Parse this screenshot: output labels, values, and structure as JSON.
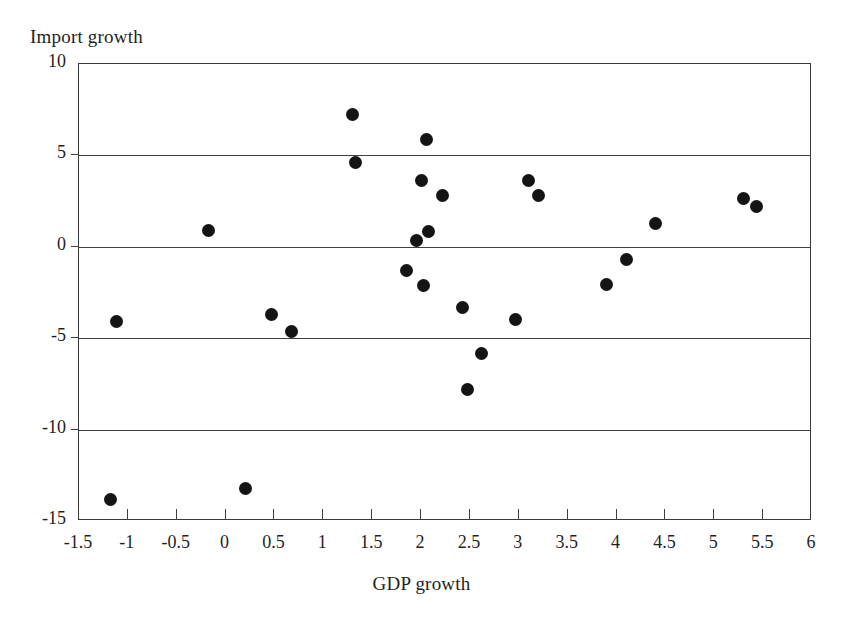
{
  "chart": {
    "type": "scatter",
    "ylabel": "Import growth",
    "xlabel": "GDP growth",
    "title": ""
  },
  "chart_data": {
    "type": "scatter",
    "title": "",
    "xlabel": "GDP growth",
    "ylabel": "Import growth",
    "xlim": [
      -1.5,
      6
    ],
    "ylim": [
      -15,
      10
    ],
    "xticks": [
      -1.5,
      -1,
      -0.5,
      0,
      0.5,
      1,
      1.5,
      2,
      2.5,
      3,
      3.5,
      4,
      4.5,
      5,
      5.5,
      6
    ],
    "xtick_labels": [
      "-1.5",
      "-1",
      "-0.5",
      "0",
      "0.5",
      "1",
      "1.5",
      "2",
      "2.5",
      "3",
      "3.5",
      "4",
      "4.5",
      "5",
      "5.5",
      "6"
    ],
    "yticks": [
      10,
      5,
      0,
      -5,
      -10,
      -15
    ],
    "ytick_labels": [
      "10",
      "5",
      "0",
      "-5",
      "-10",
      "-15"
    ],
    "grid": "horizontal",
    "legend": "none",
    "marker": "filled-circle",
    "marker_color": "#141414",
    "points": [
      {
        "x": -1.18,
        "y": -13.8
      },
      {
        "x": -1.12,
        "y": -4.1
      },
      {
        "x": -0.17,
        "y": 0.9
      },
      {
        "x": 0.2,
        "y": -13.2
      },
      {
        "x": 0.47,
        "y": -3.7
      },
      {
        "x": 0.67,
        "y": -4.65
      },
      {
        "x": 1.3,
        "y": 7.25
      },
      {
        "x": 1.33,
        "y": 4.6
      },
      {
        "x": 1.85,
        "y": -1.3
      },
      {
        "x": 1.95,
        "y": 0.35
      },
      {
        "x": 2.0,
        "y": 3.6
      },
      {
        "x": 2.03,
        "y": -2.1
      },
      {
        "x": 2.06,
        "y": 5.85
      },
      {
        "x": 2.08,
        "y": 0.85
      },
      {
        "x": 2.22,
        "y": 2.8
      },
      {
        "x": 2.42,
        "y": -3.3
      },
      {
        "x": 2.47,
        "y": -7.8
      },
      {
        "x": 2.62,
        "y": -5.85
      },
      {
        "x": 2.97,
        "y": -3.95
      },
      {
        "x": 3.1,
        "y": 3.65
      },
      {
        "x": 3.2,
        "y": 2.8
      },
      {
        "x": 3.9,
        "y": -2.05
      },
      {
        "x": 4.1,
        "y": -0.7
      },
      {
        "x": 4.4,
        "y": 1.25
      },
      {
        "x": 5.3,
        "y": 2.65
      },
      {
        "x": 5.43,
        "y": 2.2
      }
    ]
  }
}
